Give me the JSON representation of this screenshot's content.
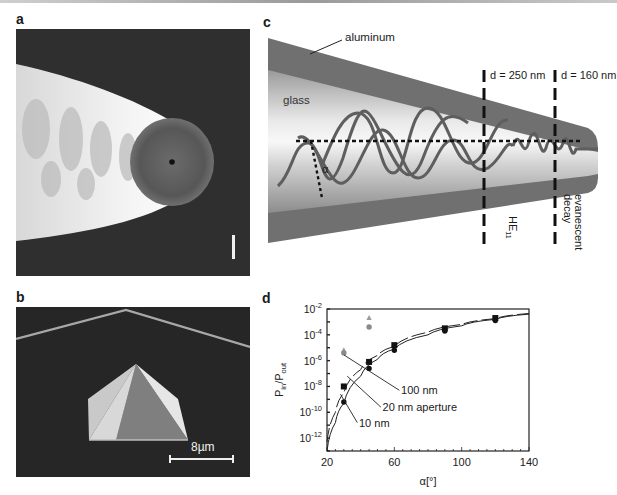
{
  "figure": {
    "panels": [
      {
        "id": "a",
        "label": "a",
        "type": "SEM micrograph",
        "description": "Aluminum-coated tapered optical fiber probe with circular aperture at tip",
        "scale_bar_text": ""
      },
      {
        "id": "b",
        "label": "b",
        "type": "SEM micrograph",
        "description": "Pyramidal probe on cantilever",
        "scale_bar_text": "8µm"
      },
      {
        "id": "c",
        "label": "c",
        "type": "schematic"
      },
      {
        "id": "d",
        "label": "d",
        "type": "chart"
      }
    ]
  },
  "panel_c": {
    "label": "c",
    "labels": {
      "aluminum": "aluminum",
      "glass": "glass",
      "alpha": "α",
      "d1": "d = 250 nm",
      "d2": "d = 160 nm",
      "mode": "HE",
      "mode_sub": "11",
      "evanescent_1": "evanescent",
      "evanescent_2": "decay"
    },
    "colors": {
      "aluminum": "#6e6e6e",
      "glass_light": "#f2f2f2",
      "glass_dark": "#8a8a8a",
      "wave": "#5a5a5a",
      "dash": "#111111"
    }
  },
  "panel_a": {
    "label": "a"
  },
  "panel_b": {
    "label": "b",
    "scale_bar": "8µm"
  },
  "panel_d": {
    "label": "d"
  },
  "chart_data": {
    "type": "scatter",
    "title": "",
    "xlabel": "α[°]",
    "ylabel": "P_in/P_out",
    "ylabel_main": "P",
    "ylabel_sub1": "in",
    "ylabel_sep": "/P",
    "ylabel_sub2": "out",
    "xlim": [
      20,
      140
    ],
    "ylim_log10": [
      -13,
      -2
    ],
    "y_scale": "log",
    "grid": false,
    "x_ticks": [
      20,
      60,
      100,
      140
    ],
    "x_tick_labels": [
      "20",
      "60",
      "100",
      "140"
    ],
    "y_ticks_log10": [
      -2,
      -4,
      -6,
      -8,
      -10,
      -12
    ],
    "y_tick_labels": [
      "10",
      "10",
      "10",
      "10",
      "10",
      "10"
    ],
    "y_tick_exponents": [
      "-2",
      "-4",
      "-6",
      "-8",
      "-10",
      "-12"
    ],
    "series": [
      {
        "name": "100 nm",
        "marker": "square",
        "color": "#111111",
        "x": [
          30,
          45,
          60,
          90,
          120
        ],
        "log10_y": [
          -8.0,
          -6.1,
          -4.8,
          -3.5,
          -2.7
        ]
      },
      {
        "name": "20 nm aperture",
        "marker": "none (dashed fit)",
        "color": "#111111",
        "x": [
          20,
          30,
          45,
          60,
          90,
          120,
          140
        ],
        "log10_y": [
          -11.5,
          -8.6,
          -6.3,
          -5.0,
          -3.6,
          -2.8,
          -2.3
        ]
      },
      {
        "name": "10 nm",
        "marker": "circle",
        "color": "#111111",
        "x": [
          30,
          45,
          60,
          90,
          120
        ],
        "log10_y": [
          -9.2,
          -6.6,
          -5.2,
          -3.7,
          -2.9
        ]
      },
      {
        "name": "outlier triangles",
        "marker": "triangle",
        "color": "#9a9a9a",
        "x": [
          30,
          45
        ],
        "log10_y": [
          -5.2,
          -2.7
        ]
      },
      {
        "name": "outlier circles",
        "marker": "circle",
        "color": "#8a8a8a",
        "x": [
          30,
          45
        ],
        "log10_y": [
          -5.4,
          -3.4
        ]
      }
    ],
    "fit_curves": [
      {
        "name": "10 nm fit",
        "style": "solid",
        "x": [
          20,
          25,
          30,
          40,
          50,
          60,
          80,
          100,
          120,
          140
        ],
        "log10_y": [
          -13,
          -10.8,
          -9.3,
          -7.2,
          -5.9,
          -5.1,
          -4.0,
          -3.3,
          -2.8,
          -2.4
        ]
      },
      {
        "name": "100 nm fit",
        "style": "dashed",
        "x": [
          20,
          25,
          30,
          40,
          50,
          60,
          80,
          100,
          120,
          140
        ],
        "log10_y": [
          -12.3,
          -10.0,
          -8.5,
          -6.7,
          -5.6,
          -4.9,
          -3.8,
          -3.2,
          -2.75,
          -2.35
        ]
      }
    ],
    "annotations": [
      {
        "text": "100 nm",
        "points_to": "series 100 nm"
      },
      {
        "text": "20 nm aperture",
        "points_to": "series 20 nm aperture"
      },
      {
        "text": "10 nm",
        "points_to": "series 10 nm"
      }
    ],
    "legend_position": "inline annotations"
  }
}
